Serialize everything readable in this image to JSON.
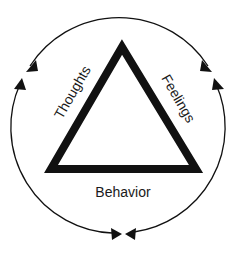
{
  "diagram": {
    "type": "cognitive-triangle",
    "labels": {
      "thoughts": "Thoughts",
      "feelings": "Feelings",
      "behavior": "Behavior"
    },
    "colors": {
      "stroke": "#111111",
      "background": "#ffffff"
    },
    "arrows": [
      {
        "from": "Thoughts",
        "to": "Feelings",
        "position": "top arc"
      },
      {
        "from": "Feelings",
        "to": "Behavior",
        "position": "right arc"
      },
      {
        "from": "Behavior",
        "to": "Thoughts",
        "position": "left arc"
      }
    ]
  }
}
